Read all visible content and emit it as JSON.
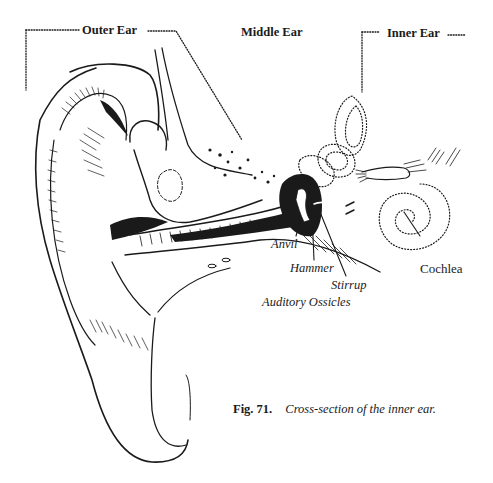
{
  "figure": {
    "section_labels": {
      "outer_ear": "Outer Ear",
      "middle_ear": "Middle Ear",
      "inner_ear": "Inner Ear"
    },
    "part_labels": {
      "anvil": "Anvil",
      "hammer": "Hammer",
      "stirrup": "Stirrup",
      "auditory_ossicles": "Auditory Ossicles",
      "cochlea": "Cochlea"
    },
    "caption": {
      "number": "Fig. 71.",
      "text": "Cross-section of the inner ear."
    },
    "colors": {
      "ink": "#1a1a1a",
      "paper": "#ffffff"
    }
  }
}
